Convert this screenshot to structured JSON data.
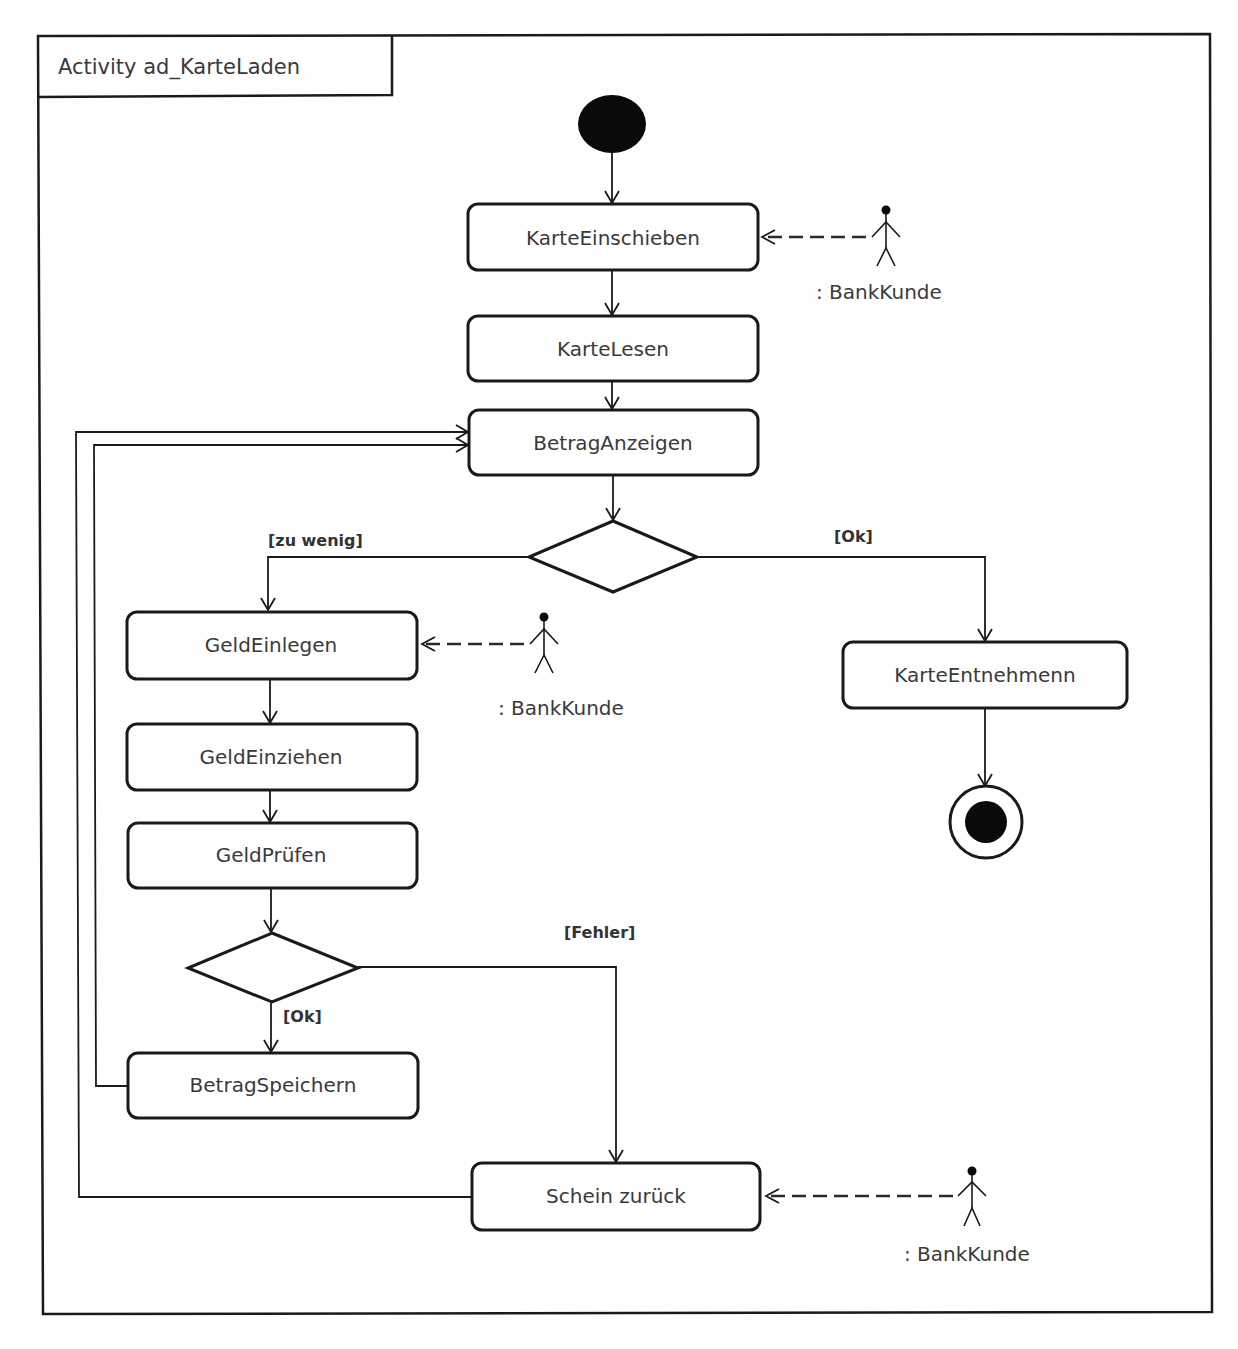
{
  "top_clipped_text": "",
  "frame": {
    "title": "Activity ad_KarteLaden"
  },
  "actions": {
    "karte_einschieben": "KarteEinschieben",
    "karte_lesen": "KarteLesen",
    "betrag_anzeigen": "BetragAnzeigen",
    "geld_einlegen": "GeldEinlegen",
    "geld_einziehen": "GeldEinziehen",
    "geld_pruefen": "GeldPrüfen",
    "betrag_speichern": "BetragSpeichern",
    "karte_entnehmen": "KarteEntnehmenn",
    "schein_zurueck": "Schein zurück"
  },
  "guards": {
    "zu_wenig": "[zu wenig]",
    "ok_main": "[Ok]",
    "fehler": "[Fehler]",
    "ok_check": "[Ok]"
  },
  "actors": {
    "actor_1": ": BankKunde",
    "actor_2": ": BankKunde",
    "actor_3": ": BankKunde"
  },
  "nodes": {
    "initial": "initial-node",
    "final": "activity-final-node",
    "decisions": [
      "decision-betrag",
      "decision-geld"
    ]
  },
  "colors": {
    "stroke": "#1a1a1a",
    "text": "#3a3a3a",
    "background": "#ffffff"
  }
}
